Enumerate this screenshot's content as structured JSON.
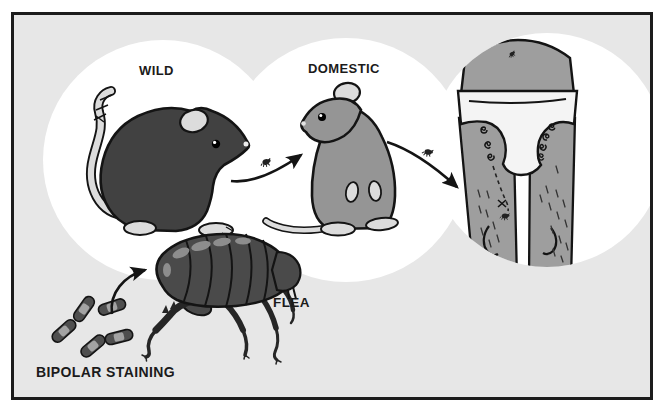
{
  "figure": {
    "type": "scientific-illustration",
    "labels": {
      "wild": "WILD",
      "domestic": "DOMESTIC",
      "flea": "FLEA",
      "bipolar_staining": "BIPOLAR STAINING"
    },
    "icons": [
      "wild-rat-icon",
      "domestic-rat-icon",
      "human-lower-body-icon",
      "flea-icon",
      "mini-flea-icon",
      "bacteria-rod-icon",
      "transmission-arrow-icon",
      "bite-spiral-icon"
    ],
    "colors": {
      "page_bg": "#ffffff",
      "panel_bg": "#e7e7e7",
      "panel_border": "#1c1c1c",
      "circle_fill": "#ffffff",
      "wild_rat": "#414141",
      "domestic_rat": "#959595",
      "human_skin": "#9e9e9e",
      "light_parts": "#dcdcdc",
      "underwear": "#f4f4f4",
      "flea_body": "#4a4a4a",
      "flea_highlight": "#8d8d8d",
      "bacteria_body": "#4f4f4f",
      "bacteria_band": "#a3a3a3",
      "ink": "#141414",
      "label_text": "#1b1b1b"
    }
  }
}
